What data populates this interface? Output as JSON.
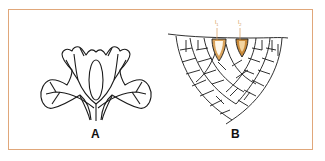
{
  "figure": {
    "panels": [
      {
        "id": "A",
        "label": "A",
        "description": "branched lobed outline with veins"
      },
      {
        "id": "B",
        "label": "B",
        "description": "cellular cross-section with two pointed initials"
      }
    ],
    "annotations": [
      {
        "label": "l",
        "subscript": "1"
      },
      {
        "label": "l",
        "subscript": "2"
      }
    ],
    "colors": {
      "border": "#e0a77a",
      "highlight": "#c98a3a",
      "line": "#1a1a1a"
    }
  }
}
